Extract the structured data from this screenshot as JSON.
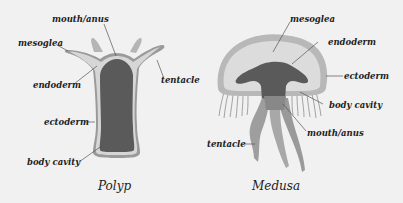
{
  "diagram": {
    "polyp": {
      "title": "Polyp",
      "labels": {
        "mouth_anus": "mouth/anus",
        "mesoglea": "mesoglea",
        "endoderm": "endoderm",
        "tentacle": "tentacle",
        "ectoderm": "ectoderm",
        "body_cavity": "body cavity"
      }
    },
    "medusa": {
      "title": "Medusa",
      "labels": {
        "mesoglea": "mesoglea",
        "endoderm": "endoderm",
        "ectoderm": "ectoderm",
        "body_cavity": "body cavity",
        "mouth_anus": "mouth/anus",
        "tentacle": "tentacle"
      }
    },
    "colors": {
      "background": "#f1f1f1",
      "ectoderm": "#9a9a9a",
      "mesoglea": "#d6d6d6",
      "endoderm_cavity": "#5a5a5a",
      "tentacle": "#a8a8a8",
      "leader_line": "#555555"
    }
  }
}
